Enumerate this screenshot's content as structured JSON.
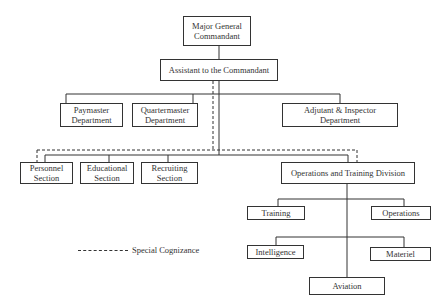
{
  "chart": {
    "title": "",
    "nodes": {
      "commandant": "Major General\nCommandant",
      "assistant": "Assistant to the Commandant",
      "paymaster": "Paymaster\nDepartment",
      "quartermaster": "Quartermaster\nDepartment",
      "adjutant": "Adjutant & Inspector\nDepartment",
      "personnel": "Personnel\nSection",
      "educational": "Educational\nSection",
      "recruiting": "Recruiting\nSection",
      "ops_training": "Operations and Training Division",
      "training": "Training",
      "operations": "Operations",
      "intelligence": "Intelligence",
      "materiel": "Materiel",
      "aviation": "Aviation"
    },
    "legend": {
      "special_cognizance": "Special Cognizance"
    }
  }
}
